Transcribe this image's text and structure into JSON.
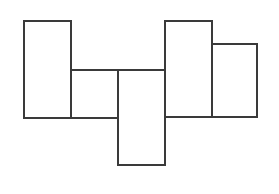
{
  "diagram": {
    "type": "rectangle-arrangement",
    "canvas": {
      "width": 279,
      "height": 194,
      "background": "#ffffff"
    },
    "stroke_color": "#3a3a3a",
    "stroke_width": 2,
    "fill_color": "#ffffff",
    "rectangles": [
      {
        "id": "rect-1",
        "x": 24,
        "y": 21,
        "width": 47,
        "height": 97
      },
      {
        "id": "rect-2",
        "x": 71,
        "y": 70,
        "width": 47,
        "height": 48
      },
      {
        "id": "rect-3",
        "x": 118,
        "y": 70,
        "width": 47,
        "height": 95
      },
      {
        "id": "rect-4",
        "x": 165,
        "y": 21,
        "width": 47,
        "height": 96
      },
      {
        "id": "rect-5",
        "x": 212,
        "y": 44,
        "width": 45,
        "height": 73
      }
    ]
  }
}
